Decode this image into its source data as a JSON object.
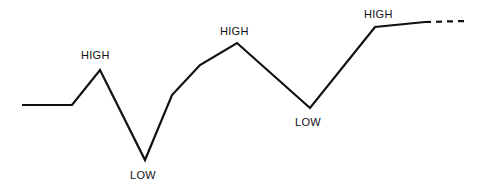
{
  "figure": {
    "background_color": "#ffffff",
    "line_color": "#111111",
    "label_color": "#111111"
  },
  "chart_data": {
    "type": "line",
    "title": "",
    "subtitle": "",
    "xlabel": "",
    "ylabel": "",
    "grid": false,
    "legend": null,
    "xlim": [
      0,
      480
    ],
    "ylim": [
      193,
      0
    ],
    "axis_visible": false,
    "series": [
      {
        "name": "price-swing-line",
        "style": "solid",
        "color": "#111111",
        "width": 2.2,
        "points": [
          [
            22,
            105
          ],
          [
            72,
            105
          ],
          [
            100,
            70
          ],
          [
            145,
            160
          ],
          [
            172,
            95
          ],
          [
            200,
            65
          ],
          [
            237,
            43
          ],
          [
            310,
            108
          ],
          [
            375,
            27
          ],
          [
            425,
            22
          ]
        ]
      },
      {
        "name": "projection-line",
        "style": "dashed",
        "color": "#111111",
        "width": 2.2,
        "dash_pattern": "6 5",
        "points": [
          [
            425,
            22
          ],
          [
            466,
            21
          ]
        ]
      }
    ],
    "annotations": [
      {
        "id": "high-1",
        "text": "HIGH",
        "x": 100,
        "y": 70,
        "label_x": 81,
        "label_y": 49,
        "anchor": "above"
      },
      {
        "id": "low-1",
        "text": "LOW",
        "x": 145,
        "y": 160,
        "label_x": 130,
        "label_y": 169,
        "anchor": "below"
      },
      {
        "id": "high-2",
        "text": "HIGH",
        "x": 237,
        "y": 43,
        "label_x": 220,
        "label_y": 25,
        "anchor": "above"
      },
      {
        "id": "low-2",
        "text": "LOW",
        "x": 310,
        "y": 108,
        "label_x": 295,
        "label_y": 116,
        "anchor": "below"
      },
      {
        "id": "high-3",
        "text": "HIGH",
        "x": 375,
        "y": 27,
        "label_x": 364,
        "label_y": 8,
        "anchor": "above"
      }
    ]
  }
}
